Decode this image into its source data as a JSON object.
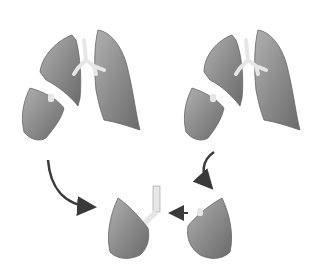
{
  "figure": {
    "title": "",
    "colors": {
      "lobe_fill": "#8f8f8f",
      "lobe_shade": "#6e6e6e",
      "lobe_light": "#b5b5b5",
      "airway": "#e4e4e4",
      "arrow": "#3a3a3a",
      "background": "#ffffff"
    },
    "donors": [
      {
        "id": "left-donor",
        "position": "top-left"
      },
      {
        "id": "right-donor",
        "position": "top-right"
      }
    ],
    "recipient": {
      "position": "bottom-center"
    },
    "arrows": [
      {
        "from": "left-donor-lobe",
        "to": "recipient-right"
      },
      {
        "from": "right-donor-lobe",
        "to": "recipient-left"
      },
      {
        "from": "recipient-left-lobe",
        "to": "recipient-airway"
      }
    ]
  }
}
